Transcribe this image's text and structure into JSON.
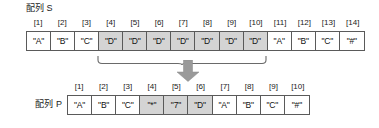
{
  "diagram": {
    "type": "array-transformation",
    "arrow_color": "#9a9a9a",
    "highlight_color": "#d4d4d4",
    "border_color": "#5a5a5a",
    "arrays": {
      "source": {
        "label": "配列 S",
        "indices": [
          "[1]",
          "[2]",
          "[3]",
          "[4]",
          "[5]",
          "[6]",
          "[7]",
          "[8]",
          "[9]",
          "[10]",
          "[11]",
          "[12]",
          "[13]",
          "[14]"
        ],
        "values": [
          "\"A\"",
          "\"B\"",
          "\"C\"",
          "\"D\"",
          "\"D\"",
          "\"D\"",
          "\"D\"",
          "\"D\"",
          "\"D\"",
          "\"D\"",
          "\"A\"",
          "\"B\"",
          "\"C\"",
          "\"#\""
        ],
        "highlighted": [
          false,
          false,
          false,
          true,
          true,
          true,
          true,
          true,
          true,
          true,
          false,
          false,
          false,
          false
        ],
        "brace_span": {
          "from_index": 4,
          "to_index": 10
        }
      },
      "result": {
        "label": "配列 P",
        "indices": [
          "[1]",
          "[2]",
          "[3]",
          "[4]",
          "[5]",
          "[6]",
          "[7]",
          "[8]",
          "[9]",
          "[10]"
        ],
        "values": [
          "\"A\"",
          "\"B\"",
          "\"C\"",
          "\"*\"",
          "\"7\"",
          "\"D\"",
          "\"A\"",
          "\"B\"",
          "\"C\"",
          "\"#\""
        ],
        "highlighted": [
          false,
          false,
          false,
          true,
          true,
          true,
          false,
          false,
          false,
          false
        ]
      }
    }
  }
}
